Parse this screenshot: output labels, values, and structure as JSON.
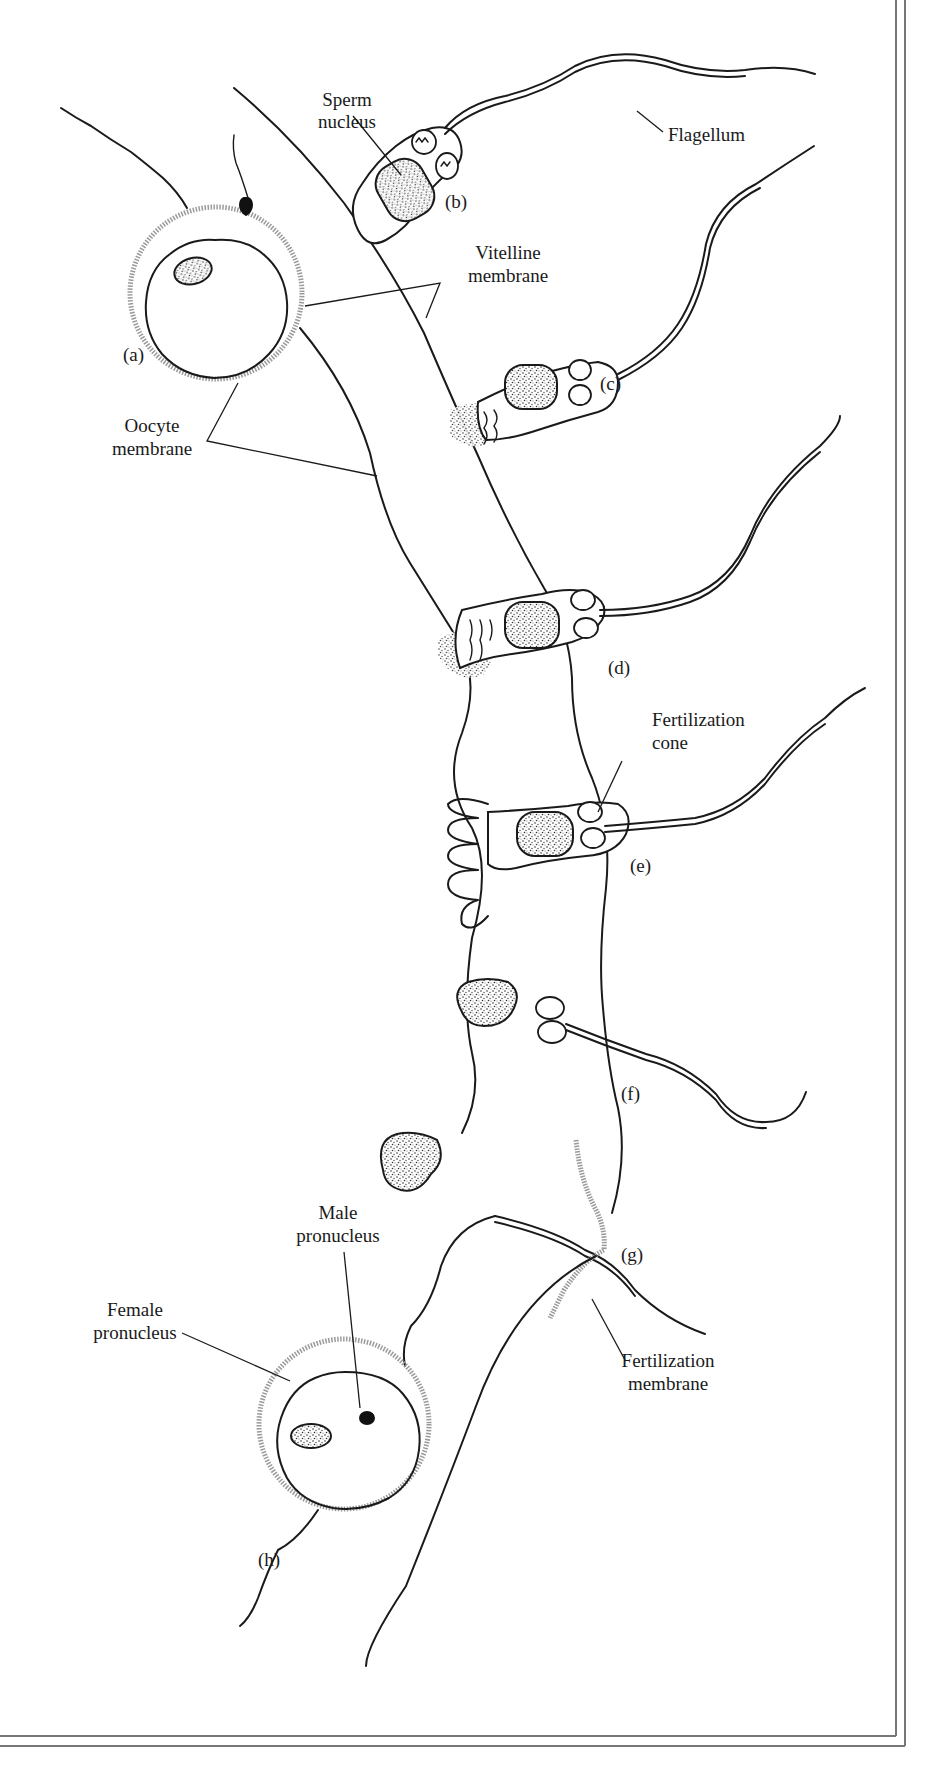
{
  "figure": {
    "type": "scientific illustration",
    "stage_labels": [
      {
        "id": "a",
        "text": "(a)"
      },
      {
        "id": "b",
        "text": "(b)"
      },
      {
        "id": "c",
        "text": "(c)"
      },
      {
        "id": "d",
        "text": "(d)"
      },
      {
        "id": "e",
        "text": "(e)"
      },
      {
        "id": "f",
        "text": "(f)"
      },
      {
        "id": "g",
        "text": "(g)"
      },
      {
        "id": "h",
        "text": "(h)"
      }
    ],
    "callouts": {
      "sperm_nucleus": [
        "Sperm",
        "nucleus"
      ],
      "flagellum": [
        "Flagellum"
      ],
      "vitelline_membrane": [
        "Vitelline",
        "membrane"
      ],
      "oocyte_membrane": [
        "Oocyte",
        "membrane"
      ],
      "fertilization_cone": [
        "Fertilization",
        "cone"
      ],
      "male_pronucleus": [
        "Male",
        "pronucleus"
      ],
      "female_pronucleus": [
        "Female",
        "pronucleus"
      ],
      "fertilization_membrane": [
        "Fertilization",
        "membrane"
      ]
    },
    "colors": {
      "ink": "#1a1a1a",
      "stipple": "#9a9a9a",
      "frame": "#777777",
      "background": "#ffffff"
    }
  }
}
